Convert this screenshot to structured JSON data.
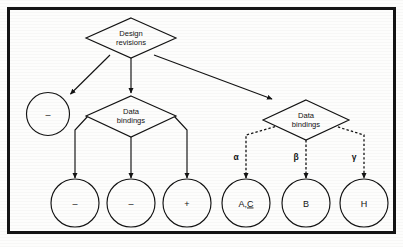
{
  "diagram": {
    "title_present": false,
    "background_color": "#fdfdfc",
    "ink_color": "#131313",
    "frame": {
      "border_color": "#141414",
      "border_width": 3
    },
    "nodes": {
      "root_diamond": {
        "label_line1": "Design",
        "label_line2": "revisions"
      },
      "left_diamond": {
        "label_line1": "Data",
        "label_line2": "bindings"
      },
      "right_diamond": {
        "label_line1": "Data",
        "label_line2": "bindings"
      },
      "orphan_circle": {
        "label": "–"
      },
      "left_circle_1": {
        "label": "–"
      },
      "left_circle_2": {
        "label": "–"
      },
      "left_circle_3": {
        "label": "+"
      },
      "right_circle_1": {
        "label_plain": "A,",
        "label_underlined": "C"
      },
      "right_circle_2": {
        "label": "B"
      },
      "right_circle_3": {
        "label": "H"
      }
    },
    "edge_labels": {
      "alpha": "α",
      "beta": "β",
      "gamma": "γ"
    },
    "edge_styles": {
      "root_edges": "solid",
      "left_branch_edges": "solid",
      "right_branch_edges": "dashed"
    }
  }
}
